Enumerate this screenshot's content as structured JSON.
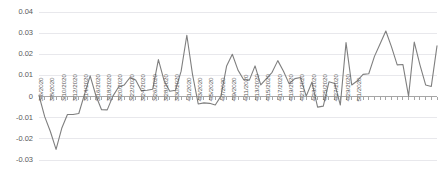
{
  "chart_data": {
    "type": "line",
    "title": "",
    "subtitle": "",
    "xlabel": "",
    "ylabel": "",
    "grid": true,
    "legend": false,
    "legend_position": "none",
    "line_color": "#7f7f7f",
    "ylim": [
      -0.03,
      0.04
    ],
    "yticks": [
      0.04,
      0.03,
      0.02,
      0.01,
      0,
      -0.01,
      -0.02,
      -0.03
    ],
    "ytick_labels": [
      "0.04",
      "0.03",
      "0.02",
      "0.01",
      "0",
      "-0.01",
      "-0.02",
      "-0.03"
    ],
    "xtick_labels": [
      "3/6/2020",
      "3/8/2020",
      "3/10/2020",
      "3/12/2020",
      "3/14/2020",
      "3/16/2020",
      "3/18/2020",
      "3/20/2020",
      "3/22/2020",
      "3/24/2020",
      "3/26/2020",
      "3/28/2020",
      "3/30/2020",
      "4/1/2020",
      "4/3/2020",
      "4/5/2020",
      "4/7/2020",
      "4/9/2020",
      "4/11/2020",
      "4/13/2020",
      "4/15/2020",
      "4/17/2020",
      "4/19/2020",
      "4/21/2020",
      "4/23/2020",
      "4/25/2020",
      "4/27/2020",
      "4/29/2020",
      "5/1/2020"
    ],
    "xtick_every_n_points": 2,
    "x": [
      "3/6/2020",
      "3/7/2020",
      "3/8/2020",
      "3/9/2020",
      "3/10/2020",
      "3/11/2020",
      "3/12/2020",
      "3/13/2020",
      "3/14/2020",
      "3/15/2020",
      "3/16/2020",
      "3/17/2020",
      "3/18/2020",
      "3/19/2020",
      "3/20/2020",
      "3/21/2020",
      "3/22/2020",
      "3/23/2020",
      "3/24/2020",
      "3/25/2020",
      "3/26/2020",
      "3/27/2020",
      "3/28/2020",
      "3/29/2020",
      "3/30/2020",
      "3/31/2020",
      "4/1/2020",
      "4/2/2020",
      "4/3/2020",
      "4/4/2020",
      "4/5/2020",
      "4/6/2020",
      "4/7/2020",
      "4/8/2020",
      "4/9/2020",
      "4/10/2020",
      "4/11/2020",
      "4/12/2020",
      "4/13/2020",
      "4/14/2020",
      "4/15/2020",
      "4/16/2020",
      "4/17/2020",
      "4/18/2020",
      "4/19/2020",
      "4/20/2020",
      "4/21/2020",
      "4/22/2020",
      "4/23/2020",
      "4/24/2020",
      "4/25/2020",
      "4/26/2020",
      "4/27/2020",
      "4/28/2020",
      "4/29/2020",
      "4/30/2020",
      "5/1/2020"
    ],
    "values": [
      0.0005,
      -0.0095,
      -0.0165,
      -0.025,
      -0.015,
      -0.0085,
      -0.0085,
      -0.008,
      0.001,
      0.0098,
      0.0005,
      -0.0062,
      -0.0063,
      0.0002,
      0.0045,
      0.0055,
      0.009,
      0.0078,
      0.0028,
      0.003,
      0.0035,
      0.0175,
      0.0075,
      0.0025,
      0.003,
      0.012,
      0.029,
      0.0105,
      -0.0035,
      -0.003,
      -0.0032,
      -0.004,
      0.0002,
      0.0145,
      0.02,
      0.0125,
      0.008,
      0.0078,
      0.0145,
      0.0055,
      0.0085,
      0.0115,
      0.017,
      0.012,
      0.006,
      0.0085,
      0.009,
      0.0002,
      0.0068,
      -0.005,
      -0.0045,
      0.007,
      0.0062,
      -0.004,
      0.0255,
      0.0055,
      0.0075
    ],
    "value_labels": {
      "min": -0.025,
      "max": 0.031,
      "first": 0.0005,
      "last": 0.024
    },
    "values_tail": [
      0.0105,
      0.0108,
      0.019,
      0.025,
      0.031,
      0.0235,
      0.015,
      0.0152,
      0.0002,
      0.0258,
      0.015,
      0.0055,
      0.0048,
      0.024
    ]
  }
}
